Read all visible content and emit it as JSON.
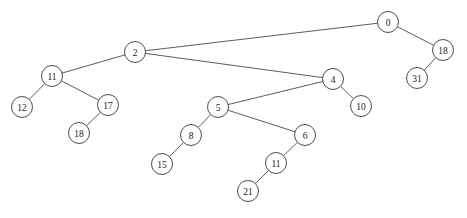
{
  "diagram": {
    "type": "binary-tree",
    "title": "",
    "canvas": {
      "width": 467,
      "height": 218,
      "background": "#ffffff"
    },
    "style": {
      "node_fill": "#ffffff",
      "node_stroke": "#3a3a3a",
      "edge_stroke": "#4a4a4a",
      "label_color": "#1a1a1a",
      "node_radius": 10.5
    },
    "nodes": [
      {
        "id": "n0",
        "label": "0",
        "x": 388,
        "y": 22,
        "r": 10.5
      },
      {
        "id": "n1",
        "label": "18",
        "x": 443,
        "y": 50,
        "r": 10.5
      },
      {
        "id": "n2",
        "label": "31",
        "x": 417,
        "y": 78,
        "r": 10.5
      },
      {
        "id": "n3",
        "label": "2",
        "x": 135,
        "y": 52,
        "r": 10.5
      },
      {
        "id": "n4",
        "label": "11",
        "x": 52,
        "y": 76,
        "r": 10.5
      },
      {
        "id": "n5",
        "label": "12",
        "x": 22,
        "y": 107,
        "r": 10.5
      },
      {
        "id": "n6",
        "label": "17",
        "x": 108,
        "y": 105,
        "r": 10.5
      },
      {
        "id": "n7",
        "label": "18",
        "x": 79,
        "y": 133,
        "r": 10.5
      },
      {
        "id": "n8",
        "label": "4",
        "x": 333,
        "y": 79,
        "r": 10.5
      },
      {
        "id": "n9",
        "label": "10",
        "x": 361,
        "y": 106,
        "r": 10.5
      },
      {
        "id": "n10",
        "label": "5",
        "x": 218,
        "y": 107,
        "r": 10.5
      },
      {
        "id": "n11",
        "label": "8",
        "x": 191,
        "y": 135,
        "r": 10.5
      },
      {
        "id": "n12",
        "label": "15",
        "x": 162,
        "y": 164,
        "r": 10.5
      },
      {
        "id": "n13",
        "label": "6",
        "x": 305,
        "y": 135,
        "r": 10.5
      },
      {
        "id": "n14",
        "label": "11",
        "x": 276,
        "y": 163,
        "r": 10.5
      },
      {
        "id": "n15",
        "label": "21",
        "x": 248,
        "y": 191,
        "r": 10.5
      }
    ],
    "edges": [
      {
        "from": "n0",
        "to": "n3"
      },
      {
        "from": "n0",
        "to": "n1"
      },
      {
        "from": "n1",
        "to": "n2"
      },
      {
        "from": "n3",
        "to": "n4"
      },
      {
        "from": "n3",
        "to": "n8"
      },
      {
        "from": "n4",
        "to": "n5"
      },
      {
        "from": "n4",
        "to": "n6"
      },
      {
        "from": "n6",
        "to": "n7"
      },
      {
        "from": "n8",
        "to": "n10"
      },
      {
        "from": "n8",
        "to": "n9"
      },
      {
        "from": "n10",
        "to": "n11"
      },
      {
        "from": "n10",
        "to": "n13"
      },
      {
        "from": "n11",
        "to": "n12"
      },
      {
        "from": "n13",
        "to": "n14"
      },
      {
        "from": "n14",
        "to": "n15"
      }
    ]
  }
}
